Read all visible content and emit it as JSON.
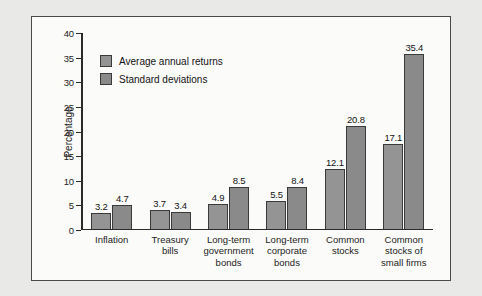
{
  "chart_data": {
    "type": "bar",
    "title": "",
    "xlabel": "",
    "ylabel": "Percentage",
    "ylim": [
      0,
      40
    ],
    "yticks": [
      0,
      5,
      10,
      15,
      20,
      25,
      30,
      35,
      40
    ],
    "grid": false,
    "legend_position": "inside-upper-left",
    "categories": [
      "Inflation",
      "Treasury\nbills",
      "Long-term\ngovernment\nbonds",
      "Long-term\ncorporate\nbonds",
      "Common\nstocks",
      "Common\nstocks of\nsmall firms"
    ],
    "series": [
      {
        "name": "Average annual returns",
        "color": "#949494",
        "values": [
          3.2,
          3.7,
          4.9,
          5.5,
          12.1,
          17.1
        ],
        "labels": [
          "3.2",
          "3.7",
          "4.9",
          "5.5",
          "12.1",
          "17.1"
        ]
      },
      {
        "name": "Standard deviations",
        "color": "#8a8a8a",
        "values": [
          4.7,
          3.4,
          8.5,
          8.4,
          20.8,
          35.4
        ],
        "labels": [
          "4.7",
          "3.4",
          "8.5",
          "8.4",
          "20.8",
          "35.4"
        ]
      }
    ]
  },
  "figure": {
    "background": "#fbfbfa",
    "border_color": "#4a4a4a",
    "page_background": "#e9e9e7"
  }
}
